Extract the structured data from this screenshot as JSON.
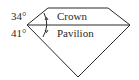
{
  "diagram": {
    "crown_angle": "34°",
    "pavilion_angle": "41°",
    "crown_label": "Crown",
    "pavilion_label": "Pavilion",
    "stroke_color": "#2a2a2a",
    "background": "#ffffff"
  }
}
